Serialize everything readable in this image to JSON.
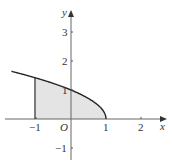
{
  "chart_data": {
    "type": "area",
    "title": "",
    "function": "y = sqrt(1 - x)",
    "x": [
      -1.7,
      -1,
      -0.5,
      0,
      0.5,
      0.75,
      0.9,
      1
    ],
    "y": [
      1.643,
      1.414,
      1.225,
      1,
      0.707,
      0.5,
      0.316,
      0
    ],
    "shaded_region": {
      "x_from": -1,
      "x_to": 1,
      "color": "#e6e6e6"
    },
    "xlabel": "x",
    "ylabel": "y",
    "origin_label": "O",
    "x_ticks": [
      "-1",
      "1",
      "2"
    ],
    "y_ticks": [
      "-1",
      "1",
      "2",
      "3"
    ],
    "xlim": [
      -1.9,
      2.6
    ],
    "ylim": [
      -1.6,
      3.8
    ],
    "grid": false
  }
}
